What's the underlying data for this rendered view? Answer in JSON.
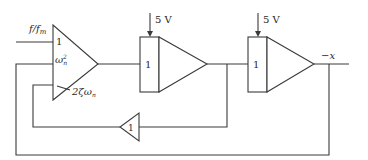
{
  "diagram": {
    "title": "",
    "type": "analog computer block diagram",
    "labels": {
      "input": "f/f_m",
      "input_display": "f/f",
      "input_sub": "m",
      "summer_gain_top": "1",
      "summer_gain_mid": "ω",
      "summer_gain_mid_sub": "n",
      "summer_gain_mid_sup": "2",
      "summer_gain_bot_coef": "2ζω",
      "summer_gain_bot_sub": "n",
      "integrator1_gain": "1",
      "integrator1_ic": "5 V",
      "integrator2_gain": "1",
      "integrator2_ic": "5 V",
      "inverter_gain": "1",
      "output": "−x"
    },
    "nodes": [
      {
        "id": "summer",
        "kind": "summing amplifier",
        "inputs": [
          "f/f_m (gain 1)",
          "ω_n^2 feedback",
          "2ζω_n feedback"
        ]
      },
      {
        "id": "integrator1",
        "kind": "integrator",
        "gain": "1",
        "initial_condition": "5 V"
      },
      {
        "id": "integrator2",
        "kind": "integrator",
        "gain": "1",
        "initial_condition": "5 V"
      },
      {
        "id": "inverter",
        "kind": "inverter",
        "gain": "1"
      }
    ],
    "edges": [
      {
        "from": "input",
        "to": "summer.in1"
      },
      {
        "from": "summer",
        "to": "integrator1"
      },
      {
        "from": "integrator1",
        "to": "integrator2"
      },
      {
        "from": "integrator1",
        "to": "inverter"
      },
      {
        "from": "inverter",
        "to": "summer.in3 (2ζω_n)"
      },
      {
        "from": "integrator2",
        "to": "output (−x)"
      },
      {
        "from": "integrator2",
        "to": "summer.in2 (ω_n^2)"
      }
    ]
  }
}
